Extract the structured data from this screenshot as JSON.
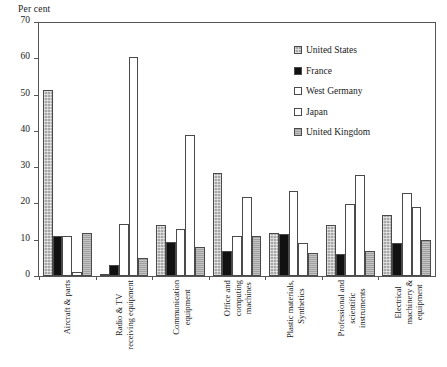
{
  "chart_data": {
    "type": "bar",
    "title": "",
    "subtitle": "",
    "ylabel": "Per cent",
    "xlabel": "",
    "ylim": [
      0,
      70
    ],
    "yticks": [
      0,
      10,
      20,
      30,
      40,
      50,
      60,
      70
    ],
    "grid": false,
    "legend_position": "top-right",
    "categories": [
      "Aircraft & parts",
      "Radio & TV receiving equipment",
      "Communication equipment",
      "Office and computing machines",
      "Plastic materials, Synthetics",
      "Professional and scientific instruments",
      "Electrical machinery & equipment"
    ],
    "category_lines": [
      [
        "Aircraft & parts"
      ],
      [
        "Radio & TV",
        "receiving equipment"
      ],
      [
        "Communication",
        "equipment"
      ],
      [
        "Office and",
        "computing",
        "machines"
      ],
      [
        "Plastic materials,",
        "Synthetics"
      ],
      [
        "Professional and",
        "scientific",
        "instruments"
      ],
      [
        "Electrical",
        "machinery &",
        "equipment"
      ]
    ],
    "series": [
      {
        "name": "United States",
        "key": "s-us",
        "color": "#a8a8a8",
        "pattern": "cross-hatch",
        "values": [
          51.5,
          0.5,
          14.0,
          28.5,
          12.0,
          14.0,
          17.0
        ]
      },
      {
        "name": "France",
        "key": "s-fr",
        "color": "#111111",
        "pattern": "solid",
        "values": [
          11.0,
          3.0,
          9.5,
          7.0,
          11.5,
          6.0,
          9.0
        ]
      },
      {
        "name": "West Germany",
        "key": "s-wg",
        "color": "#ffffff",
        "pattern": "open",
        "values": [
          11.0,
          14.5,
          13.0,
          11.0,
          23.5,
          20.0,
          23.0
        ]
      },
      {
        "name": "Japan",
        "key": "s-jp",
        "color": "#ffffff",
        "pattern": "open",
        "values": [
          1.0,
          60.5,
          39.0,
          22.0,
          9.0,
          28.0,
          19.0
        ]
      },
      {
        "name": "United Kingdom",
        "key": "s-uk",
        "color": "#a0a0a0",
        "pattern": "h-hatch",
        "values": [
          12.0,
          5.0,
          8.0,
          11.0,
          6.5,
          7.0,
          10.0
        ]
      }
    ]
  },
  "legend": {
    "items": [
      {
        "label": "United States",
        "key": "s-us"
      },
      {
        "label": "France",
        "key": "s-fr"
      },
      {
        "label": "West Germany",
        "key": "s-wg"
      },
      {
        "label": "Japan",
        "key": "s-jp"
      },
      {
        "label": "United Kingdom",
        "key": "s-uk"
      }
    ]
  }
}
